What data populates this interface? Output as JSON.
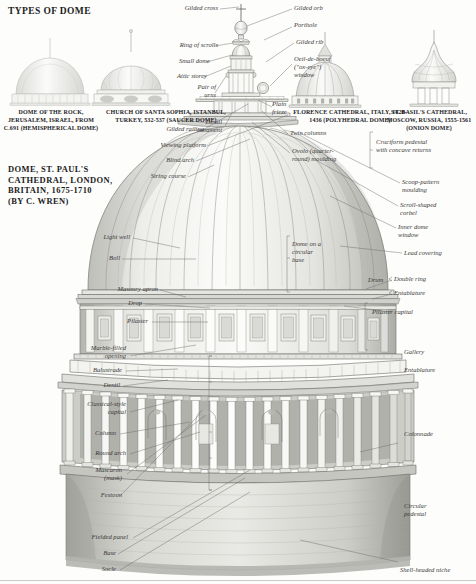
{
  "page": {
    "section_title": "TYPES OF DOME",
    "main_title": "DOME, ST. PAUL'S\nCATHEDRAL, LONDON,\nBRITAIN, 1675-1710\n(BY C. WREN)",
    "ink": "#3a3a38",
    "paper": "#fdfdfc"
  },
  "dome_types": [
    {
      "name": "dome-of-the-rock",
      "caption": "DOME OF THE\nROCK, JERUSALEM,\nISRAEL, FROM C.691\n(HEMISPHERICAL\nDOME)"
    },
    {
      "name": "santa-sophia",
      "caption": "CHURCH OF SANTA SOPHIA,\nISTANBUL, TURKEY, 532-537\n(SAUCER DOME)"
    },
    {
      "name": "florence-cathedral",
      "caption": "FLORENCE CATHEDRAL,\nITALY, 1420-1436\n(POLYHEDRAL DOME)"
    },
    {
      "name": "st-basils-cathedral",
      "caption": "ST. BASIL'S CATHEDRAL,\nMOSCOW, RUSSIA,\n1555-1561\n(ONION DOME)"
    }
  ],
  "labels_left": [
    {
      "name": "gilded-cross",
      "text": "Gilded cross"
    },
    {
      "name": "ring-of-scrolls",
      "text": "Ring of scrolls"
    },
    {
      "name": "small-dome",
      "text": "Small dome"
    },
    {
      "name": "attic-storey",
      "text": "Attic storey"
    },
    {
      "name": "pair-of-urns",
      "text": "Pair of\nurns"
    },
    {
      "name": "dentil-ornament",
      "text": "Dentil\nornament"
    },
    {
      "name": "gilded-railing",
      "text": "Gilded railing"
    },
    {
      "name": "viewing-platform",
      "text": "Viewing platform"
    },
    {
      "name": "blind-arch",
      "text": "Blind arch"
    },
    {
      "name": "string-course",
      "text": "String course"
    },
    {
      "name": "light-well",
      "text": "Light well"
    },
    {
      "name": "boll",
      "text": "Boll"
    },
    {
      "name": "masonry-apron",
      "text": "Masonry apron"
    },
    {
      "name": "drop",
      "text": "Drop"
    },
    {
      "name": "pilaster",
      "text": "Pilaster"
    },
    {
      "name": "marble-filled-opening",
      "text": "Marble-filled\nopening"
    },
    {
      "name": "balustrade",
      "text": "Balustrade"
    },
    {
      "name": "dentil",
      "text": "Dentil"
    },
    {
      "name": "classical-style-capital",
      "text": "Classical-style\ncapital"
    },
    {
      "name": "column",
      "text": "Column"
    },
    {
      "name": "round-arch",
      "text": "Round arch"
    },
    {
      "name": "mascaron-mask",
      "text": "Mascaron\n(mask)"
    },
    {
      "name": "festoon",
      "text": "Festoon"
    },
    {
      "name": "fielded-panel",
      "text": "Fielded panel"
    },
    {
      "name": "base",
      "text": "Base"
    },
    {
      "name": "socle",
      "text": "Socle"
    }
  ],
  "labels_right": [
    {
      "name": "gilded-orb",
      "text": "Gilded orb"
    },
    {
      "name": "porthole",
      "text": "Porthole"
    },
    {
      "name": "gilded-rib",
      "text": "Gilded rib"
    },
    {
      "name": "oeil-de-boeuf-window",
      "text": "Oeil-de-boeuf\n(\"ox-eye\")\nwindow"
    },
    {
      "name": "plain-frieze",
      "text": "Plain\nfrieze"
    },
    {
      "name": "twin-columns",
      "text": "Twin columns"
    },
    {
      "name": "ovolo-moulding",
      "text": "Ovolo (quarter-\nround) moulding"
    },
    {
      "name": "scoop-pattern-moulding",
      "text": "Scoop-pattern\nmoulding"
    },
    {
      "name": "scroll-shaped-corbel",
      "text": "Scroll-shaped\ncorbel"
    },
    {
      "name": "inner-dome-window",
      "text": "Inner dome\nwindow"
    },
    {
      "name": "lead-covering",
      "text": "Lead covering"
    },
    {
      "name": "double-ring",
      "text": "Double ring"
    },
    {
      "name": "entablature-upper",
      "text": "Entablature"
    },
    {
      "name": "pilaster-capital",
      "text": "Pilaster capital"
    },
    {
      "name": "gallery",
      "text": "Gallery"
    },
    {
      "name": "entablature-lower",
      "text": "Entablature"
    },
    {
      "name": "colonnade",
      "text": "Colonnade"
    },
    {
      "name": "circular-pedestal",
      "text": "Circular\npedestal"
    },
    {
      "name": "shell-headed-niche",
      "text": "Shell-headed niche"
    }
  ],
  "labels_bracket": [
    {
      "name": "cruciform-pedestal",
      "text": "Cruciform pedestal\nwith concave returns"
    },
    {
      "name": "dome-on-circular-base",
      "text": "Dome on a\ncircular\nbase"
    },
    {
      "name": "drum",
      "text": "Drum"
    }
  ]
}
